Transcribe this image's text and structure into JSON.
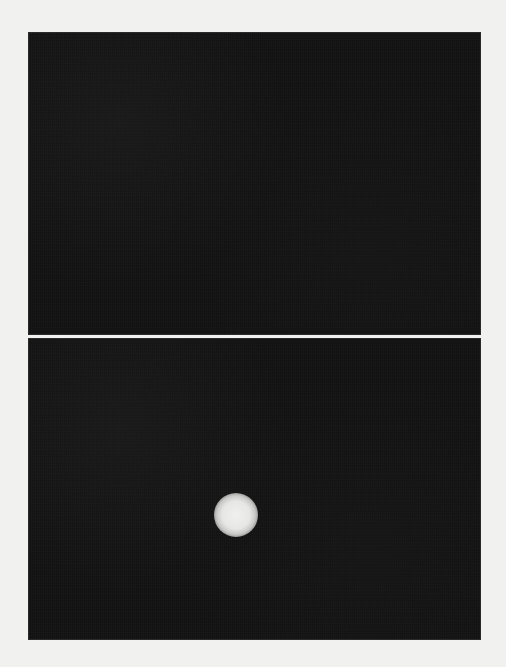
{
  "figure": {
    "background_color": "#f1f1f0",
    "panels": [
      {
        "id": "top",
        "content": "dark field, no visible signal",
        "background_color": "#121212"
      },
      {
        "id": "bottom",
        "content": "dark field with single bright circular spot",
        "background_color": "#121212",
        "spot": {
          "center_x_px": 207,
          "center_y_px": 176,
          "radius_px": 22,
          "color": "#eeeeec"
        }
      }
    ]
  }
}
